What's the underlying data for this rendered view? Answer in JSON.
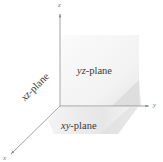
{
  "figure": {
    "type": "3d-coordinate-planes",
    "axes": {
      "x": {
        "label": "x"
      },
      "y": {
        "label": "y"
      },
      "z": {
        "label": "z"
      }
    },
    "planes": [
      {
        "id": "yz",
        "label_prefix": "yz",
        "label_suffix": "-plane"
      },
      {
        "id": "xz",
        "label_prefix": "xz",
        "label_suffix": "-plane"
      },
      {
        "id": "xy",
        "label_prefix": "xy",
        "label_suffix": "-plane"
      }
    ],
    "colors": {
      "background": "#ffffff",
      "axis_line": "#8a8a8a",
      "yz_plane_fill": "#f3f3f3",
      "plane_shadow": "#dcdcdc",
      "xy_plane_fill": "#e9e9e9",
      "label_text": "#3a3a3a"
    }
  }
}
